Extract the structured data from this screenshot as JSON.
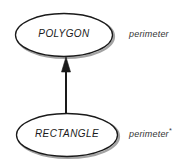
{
  "diagram": {
    "type": "class-inheritance",
    "background_color": "#ffffff",
    "stroke_color": "#1a1a1a",
    "shadow_color": "#9a9a9a",
    "nodes": [
      {
        "id": "polygon",
        "label": "POLYGON",
        "shape": "ellipse",
        "member": "perimeter",
        "member_marker": ""
      },
      {
        "id": "rectangle",
        "label": "RECTANGLE",
        "shape": "ellipse",
        "member": "perimeter",
        "member_marker": "*"
      }
    ],
    "edges": [
      {
        "id": "rectangle-to-polygon",
        "from": "rectangle",
        "to": "polygon",
        "style": "solid",
        "arrowhead": "filled-triangle",
        "direction": "up"
      }
    ]
  }
}
